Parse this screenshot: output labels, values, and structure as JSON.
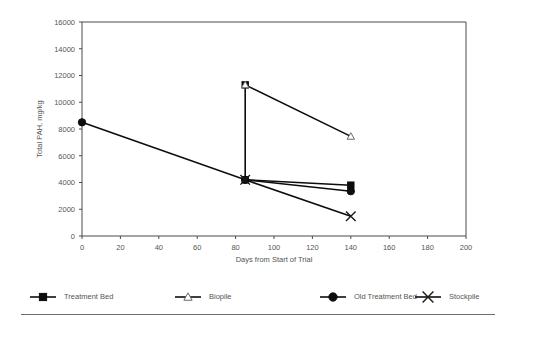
{
  "chart_data": {
    "type": "line",
    "title": "",
    "subtitle": "",
    "xlabel": "Days from Start of Trial",
    "ylabel": "Total PAH, mg/kg",
    "xlim": [
      0,
      200
    ],
    "ylim": [
      0,
      16000
    ],
    "xticks": [
      0,
      20,
      40,
      60,
      80,
      100,
      120,
      140,
      160,
      180,
      200
    ],
    "yticks": [
      0,
      2000,
      4000,
      6000,
      8000,
      10000,
      12000,
      14000,
      16000
    ],
    "grid": false,
    "legend_position": "bottom",
    "series": [
      {
        "name": "Treatment Bed",
        "marker": "filled-square",
        "x": [
          85,
          85,
          140
        ],
        "y": [
          11300,
          4200,
          3800
        ]
      },
      {
        "name": "Biopile",
        "marker": "open-triangle",
        "x": [
          85,
          140
        ],
        "y": [
          11300,
          7450
        ]
      },
      {
        "name": "Old Treatment Bed",
        "marker": "filled-circle",
        "x": [
          0,
          85,
          140
        ],
        "y": [
          8500,
          4200,
          3350
        ]
      },
      {
        "name": "Stockpile",
        "marker": "cross",
        "x": [
          85,
          140
        ],
        "y": [
          4200,
          1480
        ]
      }
    ],
    "xtick_labels": [
      "0",
      "20",
      "40",
      "60",
      "80",
      "100",
      "120",
      "140",
      "160",
      "180",
      "200"
    ],
    "ytick_labels": [
      "0",
      "2000",
      "4000",
      "6000",
      "8000",
      "10000",
      "12000",
      "14000",
      "16000"
    ]
  },
  "legend": {
    "items": [
      {
        "label": "Treatment Bed",
        "marker": "filled-square"
      },
      {
        "label": "Biopile",
        "marker": "open-triangle"
      },
      {
        "label": "Old Treatment Bed",
        "marker": "filled-circle"
      },
      {
        "label": "Stockpile",
        "marker": "cross"
      }
    ]
  },
  "colors": {
    "ink": "#0d0d0d",
    "axis": "#4a4a4a",
    "text": "#555555",
    "rule": "#6e6e6e",
    "background": "#ffffff"
  }
}
